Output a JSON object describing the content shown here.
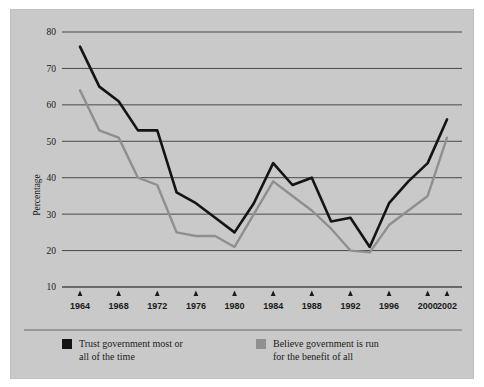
{
  "chart_data": {
    "type": "line",
    "title": "",
    "subtitle": "",
    "xlabel": "",
    "ylabel": "Percentage",
    "xlim": [
      1964,
      2002
    ],
    "ylim": [
      10,
      80
    ],
    "yticks": [
      10,
      20,
      30,
      40,
      50,
      60,
      70,
      80
    ],
    "xticks": [
      1964,
      1968,
      1972,
      1976,
      1980,
      1984,
      1988,
      1992,
      1996,
      2000,
      2002
    ],
    "grid": "horizontal",
    "legend_position": "bottom",
    "x": [
      1964,
      1966,
      1968,
      1970,
      1972,
      1974,
      1976,
      1978,
      1980,
      1982,
      1984,
      1986,
      1988,
      1990,
      1992,
      1994,
      1996,
      1998,
      2000,
      2002
    ],
    "series": [
      {
        "name": "Trust government most or all of the time",
        "color": "#141414",
        "values": [
          76,
          65,
          61,
          53,
          53,
          36,
          33,
          29,
          25,
          33,
          44,
          38,
          40,
          28,
          29,
          21,
          33,
          39,
          44,
          56
        ]
      },
      {
        "name": "Believe government is run for the benefit of all",
        "color": "#8f8f8f",
        "values": [
          64,
          53,
          51,
          40,
          38,
          25,
          24,
          24,
          21,
          30,
          39,
          35,
          31,
          26,
          20,
          19.5,
          27,
          31,
          35,
          51
        ]
      }
    ]
  },
  "axes": {
    "y_axis_title": "Percentage",
    "y_tick_labels": [
      "80",
      "70",
      "60",
      "50",
      "40",
      "30",
      "20",
      "10"
    ],
    "x_tick_labels": [
      "1964",
      "1968",
      "1972",
      "1976",
      "1980",
      "1984",
      "1988",
      "1992",
      "1996",
      "2000",
      "2002"
    ]
  },
  "legend": {
    "items": [
      {
        "swatch_color": "#141414",
        "label": "Trust government most or\nall of the time"
      },
      {
        "swatch_color": "#8f8f8f",
        "label": "Believe government is run\nfor the benefit of all"
      }
    ]
  },
  "colors": {
    "panel_background": "#c9c9c9",
    "page_background": "#ffffff",
    "gridline": "#4a4a4a",
    "text": "#1a1a1a",
    "series_black": "#141414",
    "series_gray": "#8f8f8f"
  }
}
